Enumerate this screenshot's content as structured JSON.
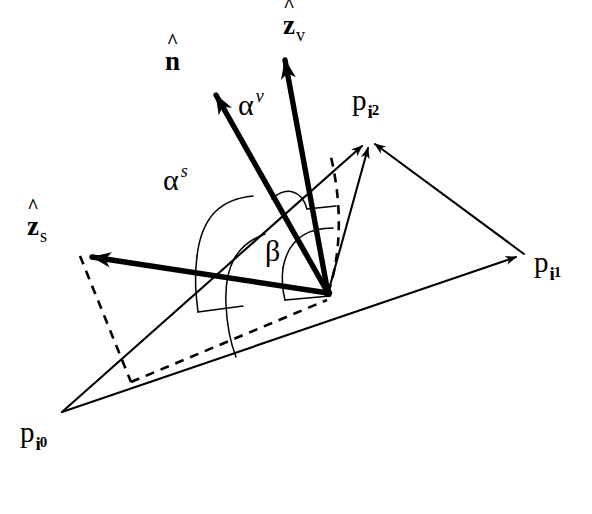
{
  "figure": {
    "kind": "geometry-diagram",
    "background_color": "#ffffff",
    "ink_color": "#000000"
  },
  "labels": {
    "normal": {
      "symbol": "n",
      "accent": "^",
      "bold": true
    },
    "view_vector": {
      "symbol": "z",
      "accent": "^",
      "subscript": "v",
      "bold": true
    },
    "source_vector": {
      "symbol": "z",
      "accent": "^",
      "subscript": "s",
      "bold": true
    },
    "alpha_v": {
      "symbol": "α",
      "superscript": "v"
    },
    "alpha_s": {
      "symbol": "α",
      "superscript": "s"
    },
    "beta": {
      "symbol": "β"
    },
    "vertex_0": {
      "symbol": "p",
      "subscript": "i",
      "subsubscript": "0"
    },
    "vertex_1": {
      "symbol": "p",
      "subscript": "i",
      "subsubscript": "1"
    },
    "vertex_2": {
      "symbol": "p",
      "subscript": "i",
      "subsubscript": "2"
    }
  },
  "geometry": {
    "triangle": {
      "p_i0": [
        62,
        412
      ],
      "p_i1": [
        524,
        254
      ],
      "p_i2": [
        367,
        140
      ]
    },
    "surface_point": [
      328,
      293
    ],
    "vectors": [
      {
        "name": "n-hat",
        "from": [
          328,
          293
        ],
        "to": [
          210,
          85
        ],
        "style": "solid-bold-arrow"
      },
      {
        "name": "z-v-hat",
        "from": [
          328,
          293
        ],
        "to": [
          282,
          48
        ],
        "style": "solid-bold-arrow"
      },
      {
        "name": "z-s-hat",
        "from": [
          328,
          293
        ],
        "to": [
          78,
          252
        ],
        "style": "solid-bold-arrow"
      }
    ],
    "edges": [
      {
        "name": "edge-i0-i1",
        "from": [
          62,
          412
        ],
        "to": [
          524,
          254
        ]
      },
      {
        "name": "edge-i0-i2",
        "from": [
          62,
          412
        ],
        "to": [
          367,
          140
        ]
      },
      {
        "name": "edge-i1-i2",
        "from": [
          524,
          254
        ],
        "to": [
          367,
          140
        ]
      }
    ],
    "interior_rays": [
      {
        "name": "ray-to-i2",
        "from": [
          328,
          293
        ],
        "to": [
          367,
          140
        ]
      }
    ],
    "dashed": [
      {
        "name": "normal-projection-up",
        "points": [
          [
            328,
            293
          ],
          [
            333,
            225
          ],
          [
            336,
            180
          ],
          [
            331,
            152
          ]
        ]
      },
      {
        "name": "zs-projection-drop",
        "points": [
          [
            78,
            252
          ],
          [
            130,
            381
          ]
        ]
      },
      {
        "name": "ground-projection",
        "points": [
          [
            130,
            381
          ],
          [
            328,
            300
          ]
        ]
      }
    ],
    "arcs": [
      {
        "name": "alpha-s-arc",
        "label": "alpha_s"
      },
      {
        "name": "alpha-v-arc",
        "label": "alpha_v"
      },
      {
        "name": "beta-arc",
        "label": "beta"
      }
    ]
  },
  "label_positions": {
    "normal": [
      165,
      48
    ],
    "view_vector": [
      283,
      12
    ],
    "source_vector": [
      27,
      213
    ],
    "alpha_v": [
      238,
      90
    ],
    "alpha_s": [
      163,
      165
    ],
    "beta": [
      265,
      236
    ],
    "vertex_0": [
      20,
      418
    ],
    "vertex_1": [
      534,
      248
    ],
    "vertex_2": [
      352,
      86
    ]
  }
}
